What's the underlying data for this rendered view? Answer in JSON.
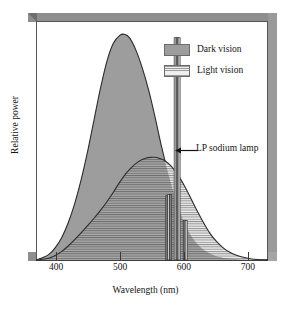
{
  "chart_data": {
    "type": "area",
    "title": "",
    "xlabel": "Wavelength (nm)",
    "ylabel": "Relative power",
    "xlim": [
      370,
      730
    ],
    "ylim": [
      0,
      1.05
    ],
    "xticks": [
      400,
      500,
      600,
      700
    ],
    "xticklabels": [
      "400",
      "500",
      "600",
      "700"
    ],
    "yticks": [],
    "grid": false,
    "legend_position": "upper right",
    "series": [
      {
        "name": "Dark vision",
        "fill": "solid-gray",
        "color": "#9d9d9d",
        "peak_x": 507,
        "peak_y": 1.0,
        "x": [
          370,
          380,
          390,
          400,
          410,
          420,
          430,
          440,
          450,
          460,
          470,
          480,
          490,
          500,
          507,
          515,
          525,
          535,
          545,
          555,
          565,
          575,
          585,
          595,
          605,
          615,
          625,
          635,
          645,
          655,
          665,
          680,
          700,
          730
        ],
        "y": [
          0.0,
          0.01,
          0.025,
          0.055,
          0.1,
          0.165,
          0.25,
          0.355,
          0.48,
          0.62,
          0.76,
          0.88,
          0.96,
          0.995,
          1.0,
          0.985,
          0.93,
          0.85,
          0.75,
          0.63,
          0.5,
          0.385,
          0.285,
          0.2,
          0.135,
          0.09,
          0.058,
          0.036,
          0.022,
          0.013,
          0.008,
          0.004,
          0.001,
          0.0
        ]
      },
      {
        "name": "Light vision",
        "fill": "horizontal-hatch",
        "color": "#9a9a9a",
        "peak_x": 555,
        "peak_y": 0.455,
        "x": [
          370,
          390,
          400,
          410,
          420,
          430,
          440,
          450,
          460,
          470,
          480,
          490,
          500,
          510,
          520,
          530,
          540,
          550,
          555,
          562,
          570,
          580,
          590,
          600,
          610,
          620,
          630,
          640,
          650,
          660,
          670,
          680,
          690,
          700,
          715,
          730
        ],
        "y": [
          0.0,
          0.008,
          0.02,
          0.038,
          0.062,
          0.09,
          0.12,
          0.152,
          0.185,
          0.22,
          0.258,
          0.3,
          0.345,
          0.385,
          0.415,
          0.438,
          0.451,
          0.455,
          0.455,
          0.45,
          0.44,
          0.415,
          0.378,
          0.33,
          0.275,
          0.218,
          0.165,
          0.118,
          0.082,
          0.055,
          0.035,
          0.022,
          0.013,
          0.007,
          0.002,
          0.0
        ]
      }
    ],
    "spikes": {
      "name": "LP sodium lamp",
      "lines": [
        {
          "x": 573,
          "y": 0.285
        },
        {
          "x": 576,
          "y": 0.29
        },
        {
          "x": 579,
          "y": 0.29
        },
        {
          "x": 586,
          "y": 0.985
        },
        {
          "x": 589,
          "y": 0.985
        },
        {
          "x": 592,
          "y": 0.985
        },
        {
          "x": 600,
          "y": 0.175
        },
        {
          "x": 603,
          "y": 0.175
        }
      ]
    },
    "annotations": [
      {
        "text": "LP sodium lamp",
        "points_to_x": 589,
        "points_to_y": 0.5
      }
    ]
  },
  "legend": {
    "items": [
      {
        "label": "Dark vision",
        "swatch": "solid-gray-swatch"
      },
      {
        "label": "Light vision",
        "swatch": "hatched-swatch"
      }
    ]
  },
  "axes": {
    "x_label": "Wavelength (nm)",
    "y_label": "Relative power",
    "x_tick_labels": [
      "400",
      "500",
      "600",
      "700"
    ]
  },
  "annotation": {
    "label": "LP sodium lamp"
  },
  "colors": {
    "dark_fill": "#9d9d9d",
    "hatch_line": "#8f8f8f",
    "curve_stroke": "#2b2b2b",
    "frame": "#8e8e8e",
    "text": "#141414"
  }
}
